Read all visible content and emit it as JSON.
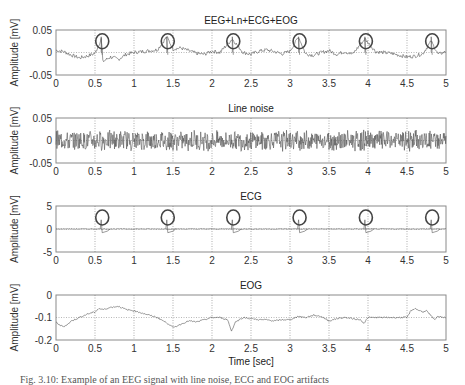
{
  "figure": {
    "xlabel": "Time [sec]",
    "caption_partial": "Fig. 3.10: Example of an EEG signal with line noise, ECG and EOG artifacts"
  },
  "chart_data": [
    {
      "type": "line",
      "title": "EEG+Ln+ECG+EOG",
      "xlabel": "",
      "ylabel": "Amplitude [mV]",
      "xlim": [
        0,
        5
      ],
      "ylim": [
        -0.05,
        0.05
      ],
      "xticks": [
        "0",
        "0.5",
        "1",
        "1.5",
        "2",
        "2.5",
        "3",
        "3.5",
        "4",
        "4.5",
        "5"
      ],
      "yticks": [
        "-0.05",
        "0",
        "0.05"
      ],
      "grid": "dotted vertical at x ticks",
      "annotations": {
        "circles_at_x": [
          0.58,
          1.42,
          2.26,
          3.11,
          3.96,
          4.81
        ],
        "circle_y": 0.025,
        "note": "circled ECG spikes"
      },
      "series": [
        {
          "name": "combined signal",
          "description": "noisy EEG around 0 mV with range ~-0.04 to 0.04, spikes at circled positions",
          "x": [
            0,
            0.1,
            0.2,
            0.3,
            0.4,
            0.5,
            0.58,
            0.6,
            0.7,
            0.8,
            0.9,
            1.0,
            1.1,
            1.2,
            1.3,
            1.42,
            1.5,
            1.6,
            1.7,
            1.8,
            1.9,
            2.0,
            2.1,
            2.26,
            2.4,
            2.5,
            2.6,
            2.7,
            2.8,
            2.9,
            3.0,
            3.11,
            3.2,
            3.3,
            3.4,
            3.5,
            3.6,
            3.7,
            3.8,
            3.96,
            4.1,
            4.2,
            4.3,
            4.4,
            4.5,
            4.6,
            4.7,
            4.81,
            4.9,
            5.0
          ],
          "y": [
            0.005,
            0.002,
            -0.006,
            -0.012,
            -0.008,
            -0.002,
            0.03,
            -0.02,
            -0.01,
            -0.015,
            -0.004,
            0.0,
            0.002,
            0.004,
            0.006,
            0.035,
            0.008,
            0.01,
            0.004,
            -0.002,
            -0.004,
            0.003,
            0.0,
            0.03,
            0.0,
            -0.004,
            0.003,
            0.006,
            0.002,
            -0.003,
            0.003,
            0.035,
            -0.003,
            -0.006,
            0.0,
            0.004,
            -0.004,
            0.002,
            -0.004,
            0.03,
            0.002,
            0.0,
            -0.002,
            -0.006,
            -0.01,
            -0.008,
            -0.003,
            0.025,
            -0.004,
            0.002
          ]
        }
      ]
    },
    {
      "type": "line",
      "title": "Line noise",
      "xlabel": "",
      "ylabel": "Amplitude [mV]",
      "xlim": [
        0,
        5
      ],
      "ylim": [
        -0.05,
        0.05
      ],
      "xticks": [
        "0",
        "0.5",
        "1",
        "1.5",
        "2",
        "2.5",
        "3",
        "3.5",
        "4",
        "4.5",
        "5"
      ],
      "yticks": [
        "-0.05",
        "0",
        "0.05"
      ],
      "grid": "dotted vertical at x ticks",
      "series": [
        {
          "name": "line noise",
          "description": "dense high-frequency noise around 0, amplitude ~±0.03 mV",
          "amplitude": 0.025
        }
      ]
    },
    {
      "type": "line",
      "title": "ECG",
      "xlabel": "",
      "ylabel": "Amplitude [mV]",
      "xlim": [
        0,
        5
      ],
      "ylim": [
        -5,
        5
      ],
      "xticks": [
        "0",
        "0.5",
        "1",
        "1.5",
        "2",
        "2.5",
        "3",
        "3.5",
        "4",
        "4.5",
        "5"
      ],
      "yticks": [
        "-5",
        "0",
        "5"
      ],
      "grid": "dotted vertical at x ticks, dotted horizontal at y=0",
      "annotations": {
        "circles_at_x": [
          0.58,
          1.42,
          2.26,
          3.11,
          3.96,
          4.81
        ],
        "circle_y": 2.5,
        "note": "circled R-peaks"
      },
      "series": [
        {
          "name": "ECG",
          "description": "flat baseline ~0 with R-peaks ~2 mV at circled times and small negative dip after each",
          "peaks_x": [
            0.58,
            1.42,
            2.26,
            3.11,
            3.96,
            4.81
          ],
          "peak_height": 2.0,
          "dip": -0.8
        }
      ]
    },
    {
      "type": "line",
      "title": "EOG",
      "xlabel": "Time [sec]",
      "ylabel": "Amplitude [mV]",
      "xlim": [
        0,
        5
      ],
      "ylim": [
        -0.2,
        0
      ],
      "xticks": [
        "0",
        "0.5",
        "1",
        "1.5",
        "2",
        "2.5",
        "3",
        "3.5",
        "4",
        "4.5",
        "5"
      ],
      "yticks": [
        "-0.2",
        "-0.1",
        "0"
      ],
      "grid": "dotted vertical at x ticks, dotted horizontal at y=-0.1",
      "series": [
        {
          "name": "EOG",
          "x": [
            0,
            0.05,
            0.1,
            0.15,
            0.2,
            0.3,
            0.4,
            0.5,
            0.55,
            0.6,
            0.7,
            0.8,
            0.9,
            1.0,
            1.1,
            1.2,
            1.3,
            1.4,
            1.45,
            1.5,
            1.6,
            1.7,
            1.8,
            1.9,
            2.0,
            2.1,
            2.2,
            2.25,
            2.3,
            2.4,
            2.5,
            2.6,
            2.7,
            2.8,
            2.9,
            3.0,
            3.1,
            3.2,
            3.3,
            3.4,
            3.5,
            3.6,
            3.7,
            3.8,
            3.9,
            3.95,
            4.0,
            4.1,
            4.2,
            4.3,
            4.4,
            4.5,
            4.55,
            4.6,
            4.7,
            4.75,
            4.8,
            4.85,
            4.9,
            5.0
          ],
          "y": [
            -0.12,
            -0.135,
            -0.14,
            -0.13,
            -0.115,
            -0.1,
            -0.085,
            -0.075,
            -0.06,
            -0.065,
            -0.055,
            -0.05,
            -0.065,
            -0.07,
            -0.08,
            -0.09,
            -0.1,
            -0.12,
            -0.13,
            -0.145,
            -0.13,
            -0.115,
            -0.12,
            -0.11,
            -0.1,
            -0.1,
            -0.11,
            -0.16,
            -0.12,
            -0.1,
            -0.105,
            -0.11,
            -0.11,
            -0.115,
            -0.11,
            -0.11,
            -0.095,
            -0.1,
            -0.09,
            -0.095,
            -0.115,
            -0.105,
            -0.1,
            -0.105,
            -0.11,
            -0.125,
            -0.1,
            -0.1,
            -0.1,
            -0.1,
            -0.1,
            -0.1,
            -0.07,
            -0.06,
            -0.075,
            -0.07,
            -0.09,
            -0.11,
            -0.095,
            -0.1
          ]
        }
      ]
    }
  ]
}
